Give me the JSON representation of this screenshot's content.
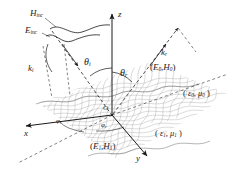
{
  "figure": {
    "type": "electromagnetic-scattering-diagram",
    "ink_color": "#1a1a1a",
    "mesh_color": "#7a7a7a",
    "background": "#ffffff"
  },
  "axes": {
    "z": {
      "label": "z"
    },
    "x": {
      "label": "x"
    },
    "y": {
      "label": "y"
    }
  },
  "vectors": {
    "k_incident": {
      "base": "k",
      "sub": "i"
    },
    "k_reflected": {
      "base": "k",
      "sub": "r"
    }
  },
  "incident_fields": {
    "H": {
      "base": "H",
      "sub": "inc"
    },
    "E": {
      "base": "E",
      "sub": "inc"
    }
  },
  "angles": {
    "theta_incident": {
      "base": "θ",
      "sub": "i"
    },
    "theta_reflected": {
      "base": "θ",
      "sub": "r"
    },
    "phi_left": {
      "base": "φ",
      "sub": "i"
    },
    "phi_right": {
      "base": "φ",
      "sub": "r"
    }
  },
  "field_pairs": {
    "reflected": {
      "open": "(",
      "E": "E",
      "E_sub": "0",
      "comma": ",",
      "H": "H",
      "H_sub": "0",
      "close": ")"
    },
    "transmitted": {
      "open": "(",
      "E": "E",
      "E_sub": "1",
      "comma": ",",
      "H": "H",
      "H_sub": "1",
      "close": ")"
    }
  },
  "media": {
    "upper": {
      "open": "(",
      "eps": "ε",
      "eps_sub": "0",
      "comma": ",",
      "mu": "μ",
      "mu_sub": "0",
      "close": ")"
    },
    "lower": {
      "open": "(",
      "eps": "ε",
      "eps_sub": "1",
      "comma": ",",
      "mu": "μ",
      "mu_sub": "1",
      "close": ")"
    }
  },
  "origin": {
    "label": "O"
  }
}
